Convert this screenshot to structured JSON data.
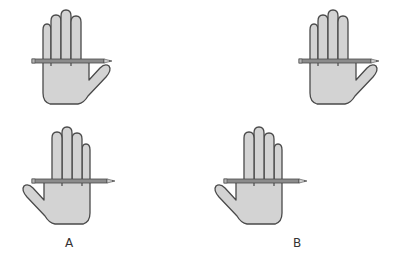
{
  "figure": {
    "colors": {
      "skin_fill": "#d3d3d3",
      "outline": "#4a4a4a",
      "pencil_fill": "#8c8c8c",
      "pencil_tip": "#6a6a6a",
      "background": "#ffffff"
    },
    "panels": [
      {
        "id": "A",
        "label": "A",
        "hands": [
          {
            "position": "top",
            "thumb_side": "right"
          },
          {
            "position": "bottom",
            "thumb_side": "left"
          }
        ]
      },
      {
        "id": "B",
        "label": "B",
        "hands": [
          {
            "position": "top",
            "thumb_side": "right"
          },
          {
            "position": "bottom",
            "thumb_side": "left"
          }
        ]
      }
    ]
  }
}
